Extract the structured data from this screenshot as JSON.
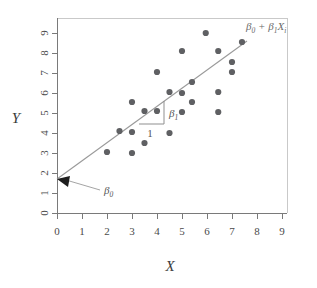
{
  "figure": {
    "background_color": "#ffffff"
  },
  "chart_data": {
    "type": "scatter",
    "title": "",
    "xlabel": "X",
    "ylabel": "Y",
    "xlim": [
      0,
      9
    ],
    "ylim": [
      0,
      9
    ],
    "xticks": [
      "0",
      "1",
      "2",
      "3",
      "4",
      "5",
      "6",
      "7",
      "8",
      "9"
    ],
    "yticks": [
      "0",
      "1",
      "2",
      "3",
      "4",
      "5",
      "6",
      "7",
      "8",
      "9"
    ],
    "grid": "off",
    "legend_position": "none",
    "point_color": "#5f6063",
    "line_color": "#9a9a9a",
    "axis_color": "#7a7a7a",
    "points": [
      {
        "x": 2.0,
        "y": 3.05
      },
      {
        "x": 2.5,
        "y": 4.1
      },
      {
        "x": 3.0,
        "y": 5.55
      },
      {
        "x": 3.0,
        "y": 4.05
      },
      {
        "x": 3.0,
        "y": 3.0
      },
      {
        "x": 3.5,
        "y": 5.1
      },
      {
        "x": 3.5,
        "y": 3.5
      },
      {
        "x": 4.0,
        "y": 7.05
      },
      {
        "x": 4.0,
        "y": 5.1
      },
      {
        "x": 4.5,
        "y": 6.05
      },
      {
        "x": 4.5,
        "y": 4.0
      },
      {
        "x": 5.0,
        "y": 8.1
      },
      {
        "x": 5.0,
        "y": 6.0
      },
      {
        "x": 5.0,
        "y": 5.05
      },
      {
        "x": 5.4,
        "y": 6.55
      },
      {
        "x": 5.4,
        "y": 5.55
      },
      {
        "x": 5.95,
        "y": 9.0
      },
      {
        "x": 6.45,
        "y": 8.1
      },
      {
        "x": 6.45,
        "y": 6.05
      },
      {
        "x": 6.45,
        "y": 5.05
      },
      {
        "x": 7.0,
        "y": 7.55
      },
      {
        "x": 7.0,
        "y": 7.05
      },
      {
        "x": 7.4,
        "y": 8.55
      }
    ],
    "fit_line": {
      "x_start": 0.0,
      "y_start": 1.7,
      "x_end": 7.6,
      "y_end": 8.6,
      "intercept": 1.7,
      "slope": 0.908,
      "equation_label": "β₀ + β₁Xᵢ",
      "equation_parts": {
        "beta": "β",
        "sub_zero": "0",
        "plus": " + ",
        "sub_one": "1",
        "x_var": "X",
        "sub_i": "i"
      }
    },
    "annotations": [
      {
        "name": "intercept-annotation",
        "label": "β₀",
        "base": "β",
        "subscript": "0",
        "target_x": 0.0,
        "target_y": 1.7,
        "description": "Arrow pointing to the y-intercept of the fitted line"
      },
      {
        "name": "slope-annotation",
        "label": "β₁",
        "base": "β",
        "subscript": "1",
        "run_label": "1",
        "run_start_x": 3.3,
        "run_end_x": 4.3,
        "rise_top_y": 5.45,
        "rise_bottom_y": 4.45,
        "description": "Slope triangle showing rise over a run of 1 unit"
      }
    ]
  },
  "axes": {
    "x_title": "X",
    "y_title": "Y"
  }
}
